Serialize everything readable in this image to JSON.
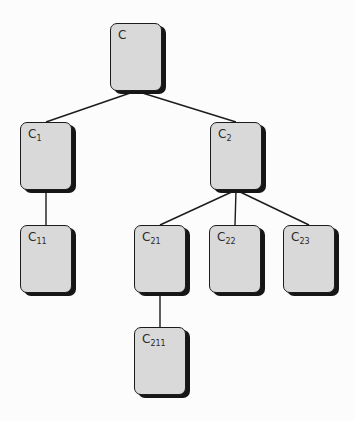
{
  "diagram": {
    "title": "",
    "colors": {
      "background": "#fcfcfc",
      "node_fill": "#d9d9d9",
      "node_border": "#1c1c1c",
      "node_shadow": "#161616",
      "edge": "#1c1c1c",
      "label": "#2a2a2a"
    },
    "nodes": [
      {
        "id": "C",
        "base": "C",
        "sub": "",
        "x": 110,
        "y": 23
      },
      {
        "id": "C1",
        "base": "C",
        "sub": "1",
        "x": 20,
        "y": 122
      },
      {
        "id": "C2",
        "base": "C",
        "sub": "2",
        "x": 210,
        "y": 122
      },
      {
        "id": "C11",
        "base": "C",
        "sub": "11",
        "x": 20,
        "y": 225
      },
      {
        "id": "C21",
        "base": "C",
        "sub": "21",
        "x": 134,
        "y": 225
      },
      {
        "id": "C22",
        "base": "C",
        "sub": "22",
        "x": 209,
        "y": 225
      },
      {
        "id": "C23",
        "base": "C",
        "sub": "23",
        "x": 283,
        "y": 225
      },
      {
        "id": "C211",
        "base": "C",
        "sub": "211",
        "x": 134,
        "y": 327
      }
    ],
    "edges": [
      {
        "from": "C",
        "to": "C1"
      },
      {
        "from": "C",
        "to": "C2"
      },
      {
        "from": "C1",
        "to": "C11"
      },
      {
        "from": "C2",
        "to": "C21"
      },
      {
        "from": "C2",
        "to": "C22"
      },
      {
        "from": "C2",
        "to": "C23"
      },
      {
        "from": "C21",
        "to": "C211"
      }
    ]
  }
}
